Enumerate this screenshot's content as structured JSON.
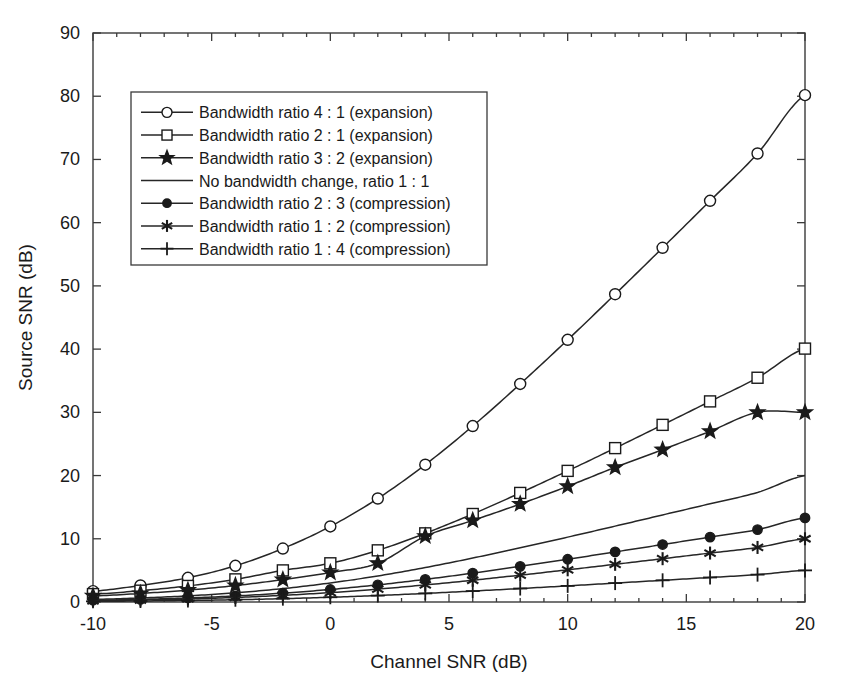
{
  "chart_data": {
    "type": "line",
    "title": "",
    "xlabel": "Channel SNR (dB)",
    "ylabel": "Source SNR (dB)",
    "xlim": [
      -10,
      20
    ],
    "ylim": [
      0,
      90
    ],
    "xticks": [
      -10,
      -5,
      0,
      5,
      10,
      15,
      20
    ],
    "xtick_labels": [
      "-10",
      "-5",
      "0",
      "5",
      "10",
      "15",
      "20"
    ],
    "yticks": [
      0,
      10,
      20,
      30,
      40,
      50,
      60,
      70,
      80,
      90
    ],
    "ytick_labels": [
      "0",
      "10",
      "20",
      "30",
      "40",
      "50",
      "60",
      "70",
      "80",
      "90"
    ],
    "grid": false,
    "legend_position": "upper left",
    "x": [
      -10,
      -8,
      -6,
      -4,
      -2,
      0,
      2,
      4,
      6,
      8,
      10,
      12,
      14,
      16,
      18,
      20
    ],
    "series": [
      {
        "name": "Bandwidth ratio 4 : 1 (expansion)",
        "marker": "circle-open",
        "values": [
          1.72,
          2.62,
          3.83,
          5.73,
          8.46,
          11.95,
          16.37,
          21.72,
          27.83,
          34.49,
          41.47,
          48.68,
          56.03,
          63.46,
          70.94,
          80.17
        ]
      },
      {
        "name": "Bandwidth ratio 2 : 1 (expansion)",
        "marker": "square-open",
        "values": [
          1.25,
          1.79,
          2.54,
          3.58,
          5.0,
          6.12,
          8.17,
          10.86,
          13.92,
          17.25,
          20.74,
          24.34,
          28.02,
          31.73,
          35.47,
          40.08
        ]
      },
      {
        "name": "Bandwidth ratio 3 : 2 (expansion)",
        "marker": "star-filled",
        "values": [
          0.97,
          1.35,
          1.88,
          2.6,
          3.54,
          4.66,
          6.13,
          10.4,
          12.9,
          15.5,
          18.3,
          21.3,
          24.1,
          27.0,
          30.0,
          30.0
        ]
      },
      {
        "name": "No bandwidth change, ratio 1 : 1",
        "marker": "none",
        "values": [
          0.41,
          0.64,
          0.97,
          1.46,
          2.12,
          3.01,
          4.12,
          5.45,
          6.95,
          8.57,
          10.26,
          12.0,
          13.77,
          15.54,
          17.33,
          20.0
        ]
      },
      {
        "name": "Bandwidth ratio 2 : 3 (compression)",
        "marker": "circle-filled",
        "values": [
          0.27,
          0.42,
          0.64,
          0.96,
          1.4,
          1.98,
          2.71,
          3.58,
          4.57,
          5.64,
          6.76,
          7.92,
          9.09,
          10.27,
          11.45,
          13.3
        ]
      },
      {
        "name": "Bandwidth ratio 1 : 2 (compression)",
        "marker": "asterisk",
        "values": [
          0.2,
          0.32,
          0.48,
          0.72,
          1.05,
          1.49,
          2.04,
          2.7,
          3.44,
          4.25,
          5.09,
          5.96,
          6.85,
          7.74,
          8.63,
          10.0
        ]
      },
      {
        "name": "Bandwidth ratio 1 : 4 (compression)",
        "marker": "plus",
        "values": [
          0.1,
          0.16,
          0.24,
          0.36,
          0.53,
          0.75,
          1.02,
          1.36,
          1.73,
          2.13,
          2.55,
          2.99,
          3.43,
          3.88,
          4.33,
          5.0
        ]
      }
    ]
  },
  "legend": {
    "items": [
      {
        "label": "Bandwidth ratio 4 : 1 (expansion)",
        "marker": "circle-open"
      },
      {
        "label": "Bandwidth ratio 2 : 1 (expansion)",
        "marker": "square-open"
      },
      {
        "label": "Bandwidth ratio 3 : 2 (expansion)",
        "marker": "star-filled"
      },
      {
        "label": "No bandwidth change, ratio 1 : 1",
        "marker": "none"
      },
      {
        "label": "Bandwidth ratio 2 : 3 (compression)",
        "marker": "circle-filled"
      },
      {
        "label": "Bandwidth ratio 1 : 2 (compression)",
        "marker": "asterisk"
      },
      {
        "label": "Bandwidth ratio 1 : 4 (compression)",
        "marker": "plus"
      }
    ]
  },
  "colors": {
    "line": "#262626",
    "axis": "#3a3a3a",
    "text": "#1a1a1a",
    "background": "#ffffff"
  }
}
